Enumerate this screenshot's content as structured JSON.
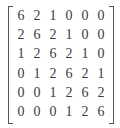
{
  "matrix": {
    "rows": 6,
    "cols": 6,
    "bracket_style": "square",
    "values": [
      [
        "6",
        "2",
        "1",
        "0",
        "0",
        "0"
      ],
      [
        "2",
        "6",
        "2",
        "1",
        "0",
        "0"
      ],
      [
        "1",
        "2",
        "6",
        "2",
        "1",
        "0"
      ],
      [
        "0",
        "1",
        "2",
        "6",
        "2",
        "1"
      ],
      [
        "0",
        "0",
        "1",
        "2",
        "6",
        "2"
      ],
      [
        "0",
        "0",
        "0",
        "1",
        "2",
        "6"
      ]
    ]
  }
}
